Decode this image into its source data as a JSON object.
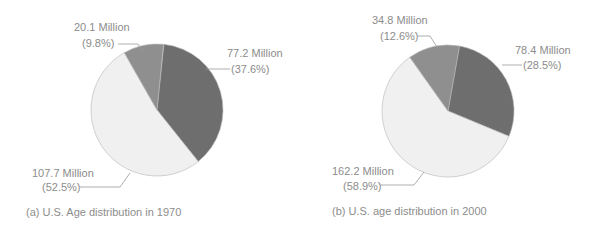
{
  "chart_data": [
    {
      "type": "pie",
      "title": "(a) U.S. Age distribution in 1970",
      "slices": [
        {
          "label": "77.2 Million",
          "value": 77.2,
          "percent": "(37.6%)",
          "pct": 37.6,
          "color": "#6e6e6e"
        },
        {
          "label": "107.7 Million",
          "value": 107.7,
          "percent": "(52.5%)",
          "pct": 52.5,
          "color": "#f0f0f0"
        },
        {
          "label": "20.1 Million",
          "value": 20.1,
          "percent": "(9.8%)",
          "pct": 9.8,
          "color": "#8f8f8f"
        }
      ]
    },
    {
      "type": "pie",
      "title": "(b) U.S. age distribution in 2000",
      "slices": [
        {
          "label": "78.4 Million",
          "value": 78.4,
          "percent": "(28.5%)",
          "pct": 28.5,
          "color": "#6e6e6e"
        },
        {
          "label": "162.2 Million",
          "value": 162.2,
          "percent": "(58.9%)",
          "pct": 58.9,
          "color": "#f0f0f0"
        },
        {
          "label": "34.8 Million",
          "value": 34.8,
          "percent": "(12.6%)",
          "pct": 12.6,
          "color": "#8f8f8f"
        }
      ]
    }
  ]
}
